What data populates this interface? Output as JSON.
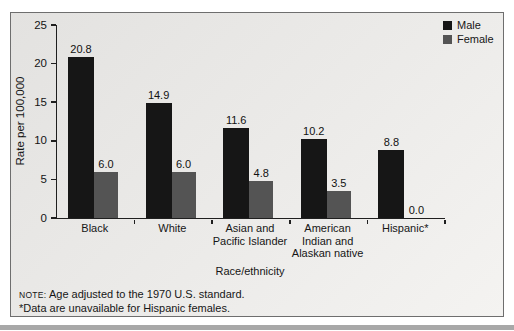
{
  "figure": {
    "background": "#ffffff",
    "panel_border_color": "#6e6e6e",
    "bottom_band_color": "#a8a8a8"
  },
  "notes": {
    "note_label": "NOTE:",
    "note_text": " Age adjusted to the 1970 U.S. standard.",
    "footnote": "*Data are unavailable for Hispanic females."
  },
  "chart_data": {
    "type": "bar",
    "title": "",
    "xlabel": "Race/ethnicity",
    "ylabel": "Rate per 100,000",
    "ylim": [
      0,
      25
    ],
    "yticks": [
      0,
      5,
      10,
      15,
      20,
      25
    ],
    "grid": false,
    "legend_position": "top-right",
    "value_label_decimals": 1,
    "categories": [
      "Black",
      "White",
      "Asian and\nPacific Islander",
      "American\nIndian and\nAlaskan native",
      "Hispanic*"
    ],
    "series": [
      {
        "name": "Male",
        "color": "#161616",
        "values": [
          20.8,
          14.9,
          11.6,
          10.2,
          8.8
        ]
      },
      {
        "name": "Female",
        "color": "#545454",
        "values": [
          6.0,
          6.0,
          4.8,
          3.5,
          0.0
        ]
      }
    ]
  }
}
